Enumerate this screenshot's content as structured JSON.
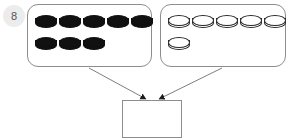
{
  "problem": {
    "number": "8",
    "type": "addition-with-counters"
  },
  "groups": [
    {
      "id": "group-dark",
      "label": "dark-counters-group",
      "counter_style": "dark",
      "count": 8,
      "rows": [
        5,
        3
      ],
      "color": "#111111"
    },
    {
      "id": "group-light",
      "label": "light-counters-group",
      "counter_style": "light",
      "count": 6,
      "rows": [
        5,
        1
      ],
      "color": "#ffffff"
    }
  ],
  "answer": {
    "value": "",
    "placeholder": ""
  },
  "arrows": [
    {
      "from": "group-dark",
      "to": "answer-box"
    },
    {
      "from": "group-light",
      "to": "answer-box"
    }
  ],
  "colors": {
    "stroke": "#8d8d8d",
    "counter_outline": "#2a2a2a",
    "counter_dark_fill": "#111111",
    "counter_light_fill": "#ffffff",
    "badge_bg": "#ececec",
    "badge_text": "#555555",
    "background": "#ffffff"
  }
}
